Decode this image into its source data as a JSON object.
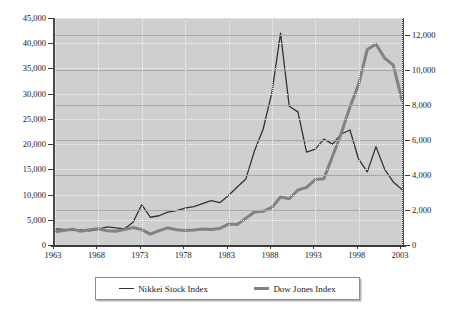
{
  "chart_data": {
    "type": "line",
    "title": "",
    "xlabel": "",
    "ylabel": "",
    "grid": true,
    "legend_position": "bottom",
    "xlim": [
      1963,
      2003
    ],
    "x_ticks": [
      1963,
      1968,
      1973,
      1978,
      1983,
      1988,
      1993,
      1998,
      2003
    ],
    "x_tick_labels": [
      "1963",
      "1968",
      "1973",
      "1978",
      "1983",
      "1988",
      "1993",
      "1998",
      "2003"
    ],
    "axes": [
      {
        "id": "left",
        "label": "",
        "ylim": [
          0,
          45000
        ],
        "ticks": [
          0,
          5000,
          10000,
          15000,
          20000,
          25000,
          30000,
          35000,
          40000,
          45000
        ],
        "tick_labels": [
          "0",
          "5,000",
          "10,000",
          "15,000",
          "20,000",
          "25,000",
          "30,000",
          "35,000",
          "40,000",
          "45,000"
        ]
      },
      {
        "id": "right",
        "label": "",
        "ylim": [
          0,
          13000
        ],
        "ticks": [
          0,
          2000,
          4000,
          6000,
          8000,
          10000,
          12000
        ],
        "tick_labels": [
          "0",
          "2,000",
          "4,000",
          "6,000",
          "8,000",
          "10,000",
          "12,000"
        ]
      }
    ],
    "x": [
      1963,
      1964,
      1965,
      1966,
      1967,
      1968,
      1969,
      1970,
      1971,
      1972,
      1973,
      1974,
      1975,
      1976,
      1977,
      1978,
      1979,
      1980,
      1981,
      1982,
      1983,
      1984,
      1985,
      1986,
      1987,
      1988,
      1989,
      1990,
      1991,
      1992,
      1993,
      1994,
      1995,
      1996,
      1997,
      1998,
      1999,
      2000,
      2001,
      2002,
      2003
    ],
    "series": [
      {
        "name": "Nikkei Stock Index",
        "axis": "left",
        "color": "#333333",
        "width": 1.3,
        "values": [
          3200,
          3100,
          2900,
          3000,
          2800,
          3100,
          3600,
          3400,
          3200,
          4500,
          8000,
          5500,
          5800,
          6500,
          6800,
          7300,
          7600,
          8200,
          8800,
          8400,
          9800,
          11500,
          13100,
          18700,
          23000,
          30200,
          42000,
          27500,
          26400,
          18400,
          19000,
          21000,
          20000,
          22000,
          22800,
          17000,
          14500,
          19500,
          15000,
          12500,
          11000
        ]
      },
      {
        "name": "Dow Jones Index",
        "axis": "right",
        "color": "#828282",
        "width": 3,
        "values": [
          760,
          830,
          910,
          790,
          880,
          930,
          820,
          790,
          880,
          1000,
          880,
          620,
          820,
          980,
          870,
          830,
          860,
          920,
          890,
          950,
          1200,
          1180,
          1530,
          1890,
          1930,
          2150,
          2750,
          2650,
          3150,
          3300,
          3750,
          3800,
          5100,
          6400,
          7900,
          9200,
          11200,
          11500,
          10700,
          10300,
          8300
        ]
      }
    ]
  }
}
